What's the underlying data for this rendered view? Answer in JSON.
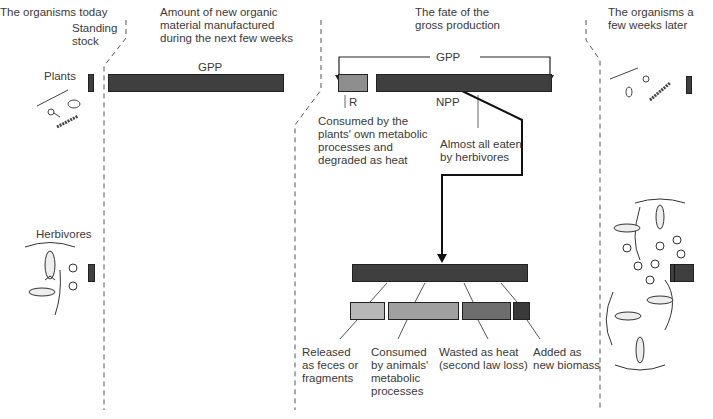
{
  "headers": {
    "today": "The organisms today",
    "standing_stock": "Standing\nstock",
    "amount_new": "Amount of new organic\nmaterial manufactured\nduring the next few weeks",
    "fate": "The fate of the\ngross production",
    "later": "The organisms a\nfew weeks later"
  },
  "labels": {
    "plants": "Plants",
    "herbivores": "Herbivores",
    "gpp_bar": "GPP",
    "gpp_bracket": "GPP",
    "r": "R",
    "npp": "NPP",
    "r_desc": "Consumed by the\nplants' own metabolic\nprocesses and\ndegraded as heat",
    "npp_desc": "Almost all eaten\nby herbivores",
    "feces": "Released\nas feces or\nfragments",
    "consumed": "Consumed\nby animals'\nmetabolic\nprocesses",
    "wasted": "Wasted as heat\n(second law loss)",
    "added": "Added as\nnew biomass"
  },
  "colors": {
    "dark_bar": "#3f3f3f",
    "r_bar": "#8e8e8e",
    "feces_bar": "#b8b8b8",
    "consumed_bar": "#a0a0a0",
    "wasted_bar": "#6e6e6e",
    "added_bar": "#3a3a3a"
  }
}
